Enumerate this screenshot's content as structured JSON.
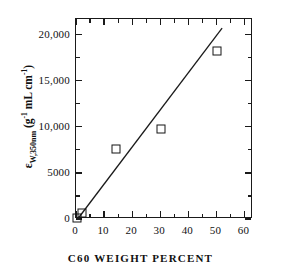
{
  "chart_data": {
    "type": "scatter",
    "title": "",
    "xlabel": "C60 WEIGHT PERCENT",
    "ylabel_plain": "eW,350nm (g^-1 mL cm^-1)",
    "ylabel_parts": {
      "symbol": "ε",
      "subscript": "W,350nm",
      "open_paren": " (g",
      "exp1": "-1",
      "middle": " mL cm",
      "exp2": "-1",
      "close_paren": ")"
    },
    "xlim": [
      0,
      63
    ],
    "ylim": [
      0,
      21700
    ],
    "xticks": [
      0,
      10,
      20,
      30,
      40,
      50,
      60
    ],
    "xtick_labels": [
      "0",
      "10",
      "20",
      "30",
      "40",
      "50",
      "60"
    ],
    "yticks": [
      0,
      5000,
      10000,
      15000,
      20000
    ],
    "ytick_labels": [
      "0",
      "5000",
      "10,000",
      "15,000",
      "20,000"
    ],
    "grid": false,
    "legend": "none",
    "marker_style": "open-square",
    "points": [
      {
        "x": 0.3,
        "y": 150,
        "label": "pure polymer"
      },
      {
        "x": 2.0,
        "y": 600,
        "label": "2% C60"
      },
      {
        "x": 14.2,
        "y": 7600,
        "label": "14% C60"
      },
      {
        "x": 30.2,
        "y": 9800,
        "label": "30% C60"
      },
      {
        "x": 50.2,
        "y": 18200,
        "label": "50% C60"
      }
    ],
    "fit_line": {
      "type": "linear",
      "x_start": 0.6,
      "y_start": 0,
      "x_end": 52.0,
      "y_end": 20700
    },
    "colors": {
      "axis": "#1a1a1a",
      "marker": "#141414",
      "line": "#1a1a1a",
      "background": "#ffffff"
    }
  }
}
